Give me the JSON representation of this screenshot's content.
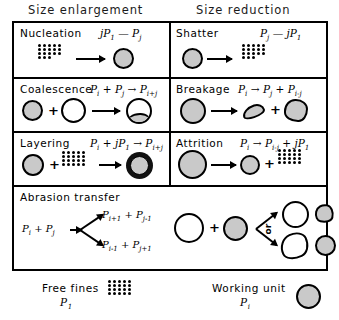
{
  "headings": {
    "left": "Size enlargement",
    "right": "Size reduction"
  },
  "mechanisms": [
    {
      "name": "Nucleation",
      "column": "enlargement",
      "equation": "jP1 — Pj",
      "eq_parts": {
        "lhs": "jP",
        "lhs_sub": "1",
        "op": "—",
        "rhs": "P",
        "rhs_sub": "j"
      },
      "visual": "dot-cluster arrow gray-circle"
    },
    {
      "name": "Coalescence",
      "column": "enlargement",
      "equation": "Pi + Pj → Pi+j",
      "eq_parts": {
        "a": "P",
        "a_sub": "i",
        "plus": "+",
        "b": "P",
        "b_sub": "j",
        "arrow": "→",
        "c": "P",
        "c_sub": "i+j"
      },
      "visual": "gray-circle plus white-circle arrow merged-circle"
    },
    {
      "name": "Layering",
      "column": "enlargement",
      "equation": "Pi + jP1 → Pi+j",
      "eq_parts": {
        "a": "P",
        "a_sub": "i",
        "plus": "+",
        "b": "jP",
        "b_sub": "1",
        "arrow": "→",
        "c": "P",
        "c_sub": "i+j"
      },
      "visual": "gray-circle plus dot-cluster arrow ringed-circle"
    },
    {
      "name": "Shatter",
      "column": "reduction",
      "equation": "Pj — jP1",
      "eq_parts": {
        "lhs": "P",
        "lhs_sub": "j",
        "op": "—",
        "rhs": "jP",
        "rhs_sub": "1"
      },
      "visual": "gray-circle arrow dot-cluster"
    },
    {
      "name": "Breakage",
      "column": "reduction",
      "equation": "Pi → Pj + Pi-j",
      "eq_parts": {
        "a": "P",
        "a_sub": "i",
        "arrow": "→",
        "b": "P",
        "b_sub": "j",
        "plus": "+",
        "c": "P",
        "c_sub": "i-j"
      },
      "visual": "gray-circle arrow fragment plus fragment"
    },
    {
      "name": "Attrition",
      "column": "reduction",
      "equation": "Pi → Pi-j + jP1",
      "eq_parts": {
        "a": "P",
        "a_sub": "i",
        "arrow": "→",
        "b": "P",
        "b_sub": "i-j",
        "plus": "+",
        "c": "jP",
        "c_sub": "1"
      },
      "visual": "large-gray-circle arrow small-gray-circle plus dot-cluster"
    }
  ],
  "abrasion": {
    "title": "Abrasion transfer",
    "reactant": {
      "a": "P",
      "a_sub": "i",
      "plus": "+",
      "b": "P",
      "b_sub": "j"
    },
    "branch_top": {
      "a": "P",
      "a_sub": "i+1",
      "plus": "+",
      "b": "P",
      "b_sub": "j-1"
    },
    "branch_bottom": {
      "a": "P",
      "a_sub": "i-1",
      "plus": "+",
      "b": "P",
      "b_sub": "j+1"
    },
    "or_label": "or",
    "plus_symbol": "+",
    "visual": "white-circle plus gray-circle branch to two outcome pairs"
  },
  "legend": [
    {
      "label": "Free fines",
      "symbol": "P",
      "symbol_sub": "1",
      "icon": "dot-cluster"
    },
    {
      "label": "Working unit",
      "symbol": "P",
      "symbol_sub": "i",
      "icon": "gray-circle"
    }
  ],
  "colors": {
    "stroke": "#000000",
    "fill_gray": "#c9c9c9",
    "fill_white": "#ffffff",
    "background": "#ffffff"
  }
}
